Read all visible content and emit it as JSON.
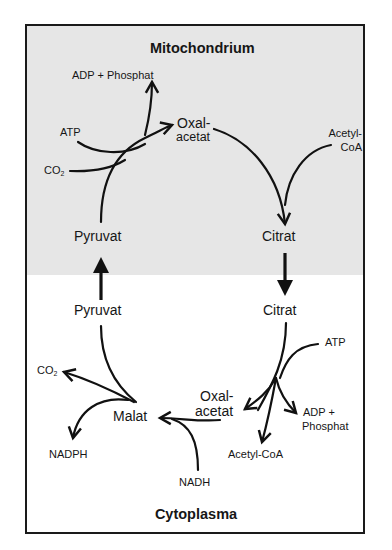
{
  "compartments": {
    "mitochondrium": {
      "title": "Mitochondrium",
      "background": "#e6e6e6"
    },
    "cytoplasma": {
      "title": "Cytoplasma",
      "background": "#ffffff"
    }
  },
  "mitochondrium_labels": {
    "adp_phosphat": "ADP + Phosphat",
    "atp": "ATP",
    "co2": "CO",
    "co2_sub": "2",
    "oxalacetat_1": "Oxal-",
    "oxalacetat_2": "acetat",
    "acetyl_coa_1": "Acetyl-",
    "acetyl_coa_2": "CoA",
    "pyruvat": "Pyruvat",
    "citrat": "Citrat"
  },
  "cytoplasma_labels": {
    "pyruvat": "Pyruvat",
    "citrat": "Citrat",
    "atp": "ATP",
    "oxalacetat_1": "Oxal-",
    "oxalacetat_2": "acetat",
    "adp_phosphat_1": "ADP +",
    "adp_phosphat_2": "Phosphat",
    "acetyl_coa": "Acetyl-CoA",
    "malat": "Malat",
    "co2": "CO",
    "co2_sub": "2",
    "nadph": "NADPH",
    "nadh": "NADH"
  },
  "transport_arrows": [
    {
      "from": "Citrat (Mitochondrium)",
      "to": "Citrat (Cytoplasma)",
      "direction": "down"
    },
    {
      "from": "Pyruvat (Cytoplasma)",
      "to": "Pyruvat (Mitochondrium)",
      "direction": "up"
    }
  ],
  "reactions": [
    {
      "compartment": "Mitochondrium",
      "inputs": [
        "Pyruvat",
        "CO2",
        "ATP"
      ],
      "outputs": [
        "Oxalacetat",
        "ADP + Phosphat"
      ]
    },
    {
      "compartment": "Mitochondrium",
      "inputs": [
        "Oxalacetat",
        "Acetyl-CoA"
      ],
      "outputs": [
        "Citrat"
      ]
    },
    {
      "compartment": "Cytoplasma",
      "inputs": [
        "Citrat",
        "ATP"
      ],
      "outputs": [
        "Oxalacetat",
        "Acetyl-CoA",
        "ADP + Phosphat"
      ]
    },
    {
      "compartment": "Cytoplasma",
      "inputs": [
        "Oxalacetat",
        "NADH"
      ],
      "outputs": [
        "Malat"
      ]
    },
    {
      "compartment": "Cytoplasma",
      "inputs": [
        "Malat"
      ],
      "outputs": [
        "Pyruvat",
        "CO2",
        "NADPH"
      ]
    }
  ]
}
